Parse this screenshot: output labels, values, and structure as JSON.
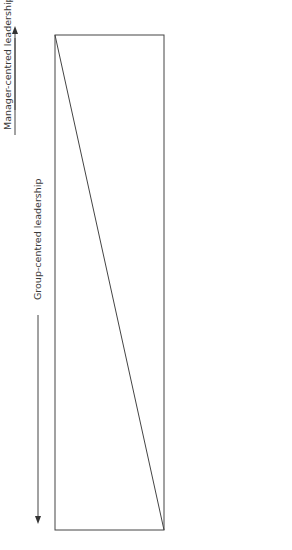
{
  "diagram": {
    "left_arrow_label": "Group-centred leadership",
    "right_arrow_label": "Manager-centred leadership",
    "upper_region_label": "Use of manager’s authority",
    "lower_region_label": "Area of freedom for colleagues/group",
    "columns": [
      {
        "lines": [
          "Manager",
          "decides",
          "and",
          "declares"
        ],
        "italic_line": 1
      },
      {
        "lines": [
          "Manager",
          "‘sells’",
          "decision to",
          "others"
        ],
        "italic_line": 1
      },
      {
        "lines": [
          "Manager",
          "outlines",
          "ideas and",
          "invites",
          "others to",
          "offer",
          "questions"
        ],
        "italic_line": 1
      },
      {
        "lines": [
          "Manager",
          "presents a",
          "tentative",
          "decision",
          "which might",
          "be changed"
        ],
        "italic_line": 1
      },
      {
        "lines": [
          "Manager",
          "defines",
          "limits of",
          "discussion",
          "and asks",
          "others to",
          "make",
          "decision"
        ],
        "italic_line": 1
      },
      {
        "lines": [
          "Manager",
          "allows",
          "others to",
          "operate",
          "within limits",
          "he or she",
          "defines"
        ],
        "italic_line": 1
      }
    ],
    "caption": "Figure 3.4  A continuum of leadership and manager behaviour (after Tannenbaum and Schmidt, 1973)"
  },
  "colors": {
    "line": "#444444",
    "text": "#3a3a3a"
  }
}
